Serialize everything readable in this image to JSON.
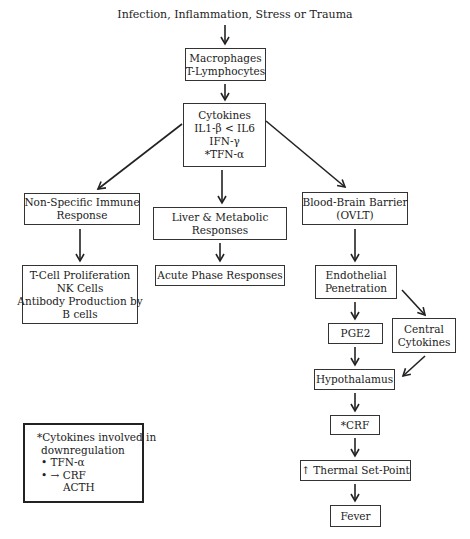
{
  "diagram": {
    "title": "Infection, Inflammation, Stress or Trauma",
    "nodes": {
      "macrophages": [
        "Macrophages",
        "T-Lymphocytes"
      ],
      "cytokines": [
        "Cytokines",
        "IL1-β < IL6",
        "IFN-γ",
        "*TFN-α"
      ],
      "nonspecific": [
        "Non-Specific Immune",
        "Response"
      ],
      "liver": [
        "Liver & Metabolic",
        "Responses"
      ],
      "bbb": [
        "Blood-Brain Barrier",
        "(OVLT)"
      ],
      "tcell": [
        "T-Cell Proliferation",
        "NK Cells",
        "Antibody Production by",
        "B cells"
      ],
      "acute": [
        "Acute Phase Responses"
      ],
      "endothelial": [
        "Endothelial",
        "Penetration"
      ],
      "pge2": [
        "PGE2"
      ],
      "central": [
        "Central",
        "Cytokines"
      ],
      "hypothalamus": [
        "Hypothalamus"
      ],
      "crf": [
        "*CRF"
      ],
      "thermal": [
        "↑ Thermal Set-Point"
      ],
      "fever": [
        "Fever"
      ]
    },
    "legend": {
      "line1": "*Cytokines involved in",
      "line2": "downregulation",
      "item1": "• TFN-α",
      "item2": "• → CRF",
      "item3": "ACTH"
    },
    "edges": [
      [
        "title",
        "macrophages"
      ],
      [
        "macrophages",
        "cytokines"
      ],
      [
        "cytokines",
        "nonspecific"
      ],
      [
        "cytokines",
        "liver"
      ],
      [
        "cytokines",
        "bbb"
      ],
      [
        "nonspecific",
        "tcell"
      ],
      [
        "liver",
        "acute"
      ],
      [
        "bbb",
        "endothelial"
      ],
      [
        "endothelial",
        "pge2"
      ],
      [
        "endothelial",
        "central"
      ],
      [
        "pge2",
        "hypothalamus"
      ],
      [
        "central",
        "hypothalamus"
      ],
      [
        "hypothalamus",
        "crf"
      ],
      [
        "crf",
        "thermal"
      ],
      [
        "thermal",
        "fever"
      ]
    ]
  }
}
